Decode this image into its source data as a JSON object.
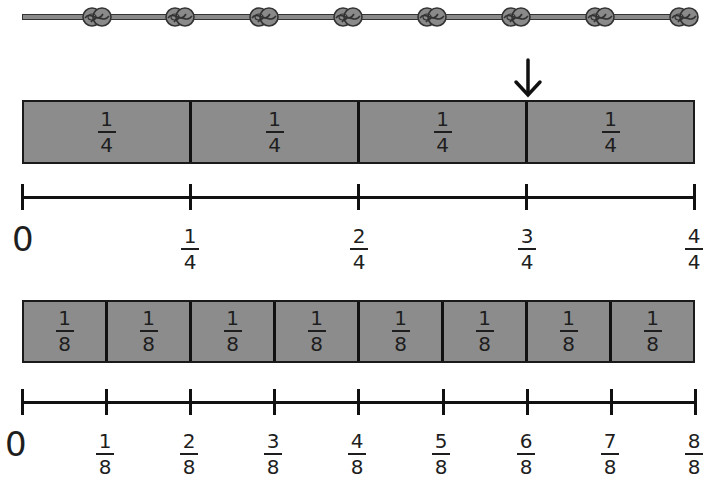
{
  "rope": {
    "icon": "rope-with-knots",
    "knot_count": 8,
    "knot_positions_x": [
      97,
      180,
      264,
      348,
      432,
      516,
      600,
      684
    ],
    "color": "#8a8a8a"
  },
  "arrow": {
    "icon": "down-arrow-icon",
    "points_to": "3/4"
  },
  "quarters_bar": {
    "fill_color": "#8c8c8c",
    "segments": [
      {
        "num": "1",
        "den": "4"
      },
      {
        "num": "1",
        "den": "4"
      },
      {
        "num": "1",
        "den": "4"
      },
      {
        "num": "1",
        "den": "4"
      }
    ]
  },
  "quarters_line": {
    "zero": "0",
    "ticks": [
      {
        "num": "1",
        "den": "4"
      },
      {
        "num": "2",
        "den": "4"
      },
      {
        "num": "3",
        "den": "4"
      },
      {
        "num": "4",
        "den": "4"
      }
    ]
  },
  "eighths_bar": {
    "fill_color": "#8c8c8c",
    "segments": [
      {
        "num": "1",
        "den": "8"
      },
      {
        "num": "1",
        "den": "8"
      },
      {
        "num": "1",
        "den": "8"
      },
      {
        "num": "1",
        "den": "8"
      },
      {
        "num": "1",
        "den": "8"
      },
      {
        "num": "1",
        "den": "8"
      },
      {
        "num": "1",
        "den": "8"
      },
      {
        "num": "1",
        "den": "8"
      }
    ]
  },
  "eighths_line": {
    "zero": "0",
    "ticks": [
      {
        "num": "1",
        "den": "8"
      },
      {
        "num": "2",
        "den": "8"
      },
      {
        "num": "3",
        "den": "8"
      },
      {
        "num": "4",
        "den": "8"
      },
      {
        "num": "5",
        "den": "8"
      },
      {
        "num": "6",
        "den": "8"
      },
      {
        "num": "7",
        "den": "8"
      },
      {
        "num": "8",
        "den": "8"
      }
    ]
  }
}
